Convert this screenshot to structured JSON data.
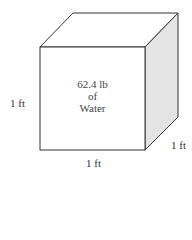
{
  "cube": {
    "content_lines": [
      "62.4 lb",
      "of",
      "Water"
    ],
    "height_label": "1 ft",
    "width_label": "1 ft",
    "depth_label": "1 ft",
    "side_face_color": "#e4e4e4",
    "edge_color": "#333333"
  }
}
